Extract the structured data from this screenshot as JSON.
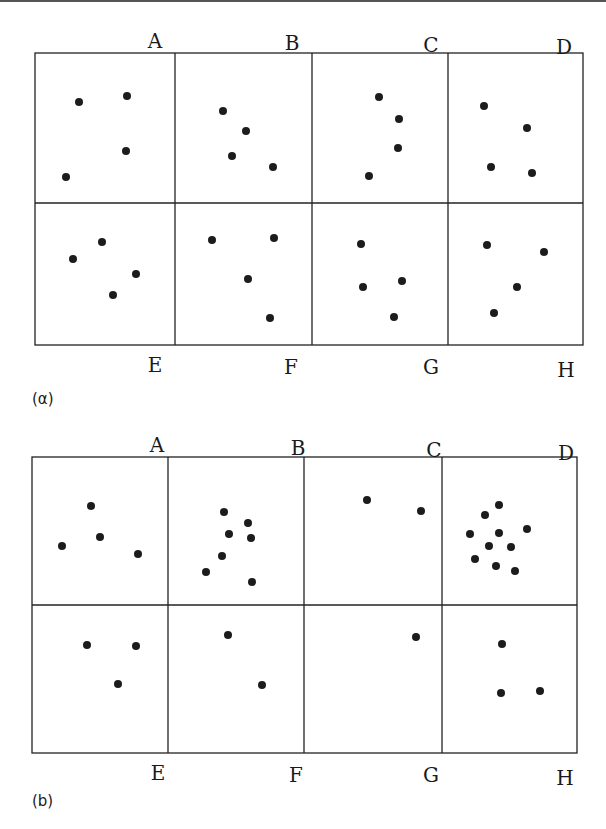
{
  "figure": {
    "panels": [
      {
        "id": "a",
        "caption": "(α)",
        "frame": {
          "x0": 35,
          "x1": 583,
          "y0": 53,
          "ymid": 203,
          "y1": 345,
          "cols": [
            35,
            175,
            312,
            448,
            583
          ]
        },
        "top_labels": [
          {
            "text": "A",
            "x": 155,
            "y": 48
          },
          {
            "text": "B",
            "x": 292,
            "y": 50
          },
          {
            "text": "C",
            "x": 431,
            "y": 52
          },
          {
            "text": "D",
            "x": 564,
            "y": 54
          }
        ],
        "bottom_labels": [
          {
            "text": "E",
            "x": 155,
            "y": 372
          },
          {
            "text": "F",
            "x": 291,
            "y": 374
          },
          {
            "text": "G",
            "x": 431,
            "y": 374
          },
          {
            "text": "H",
            "x": 566,
            "y": 377
          }
        ],
        "cells": [
          {
            "label": "A",
            "dots": [
              [
                79,
                102
              ],
              [
                127,
                96
              ],
              [
                126,
                151
              ],
              [
                66,
                177
              ]
            ]
          },
          {
            "label": "B",
            "dots": [
              [
                223,
                111
              ],
              [
                246,
                131
              ],
              [
                232,
                156
              ],
              [
                273,
                167
              ]
            ]
          },
          {
            "label": "C",
            "dots": [
              [
                379,
                97
              ],
              [
                399,
                119
              ],
              [
                398,
                148
              ],
              [
                369,
                176
              ]
            ]
          },
          {
            "label": "D",
            "dots": [
              [
                484,
                106
              ],
              [
                527,
                128
              ],
              [
                491,
                167
              ],
              [
                532,
                173
              ]
            ]
          },
          {
            "label": "E",
            "dots": [
              [
                73,
                259
              ],
              [
                102,
                242
              ],
              [
                136,
                274
              ],
              [
                113,
                295
              ]
            ]
          },
          {
            "label": "F",
            "dots": [
              [
                212,
                240
              ],
              [
                274,
                238
              ],
              [
                248,
                279
              ],
              [
                270,
                318
              ]
            ]
          },
          {
            "label": "G",
            "dots": [
              [
                361,
                244
              ],
              [
                363,
                287
              ],
              [
                402,
                281
              ],
              [
                394,
                317
              ]
            ]
          },
          {
            "label": "H",
            "dots": [
              [
                487,
                245
              ],
              [
                544,
                252
              ],
              [
                517,
                287
              ],
              [
                494,
                313
              ]
            ]
          }
        ]
      },
      {
        "id": "b",
        "caption": "(b)",
        "frame": {
          "x0": 32,
          "x1": 577,
          "y0": 457,
          "ymid": 605,
          "y1": 753,
          "cols": [
            32,
            168,
            304,
            442,
            577
          ]
        },
        "top_labels": [
          {
            "text": "A",
            "x": 157,
            "y": 452
          },
          {
            "text": "B",
            "x": 298,
            "y": 455
          },
          {
            "text": "C",
            "x": 434,
            "y": 457
          },
          {
            "text": "D",
            "x": 566,
            "y": 460
          }
        ],
        "bottom_labels": [
          {
            "text": "E",
            "x": 158,
            "y": 780
          },
          {
            "text": "F",
            "x": 296,
            "y": 782
          },
          {
            "text": "G",
            "x": 431,
            "y": 782
          },
          {
            "text": "H",
            "x": 565,
            "y": 785
          }
        ],
        "cells": [
          {
            "label": "A",
            "dots": [
              [
                91,
                506
              ],
              [
                100,
                537
              ],
              [
                62,
                546
              ],
              [
                138,
                554
              ]
            ]
          },
          {
            "label": "B",
            "dots": [
              [
                224,
                512
              ],
              [
                248,
                523
              ],
              [
                229,
                534
              ],
              [
                251,
                538
              ],
              [
                222,
                556
              ],
              [
                206,
                572
              ],
              [
                252,
                582
              ]
            ]
          },
          {
            "label": "C",
            "dots": [
              [
                367,
                500
              ],
              [
                421,
                511
              ]
            ]
          },
          {
            "label": "D",
            "dots": [
              [
                499,
                505
              ],
              [
                485,
                515
              ],
              [
                527,
                529
              ],
              [
                470,
                534
              ],
              [
                499,
                533
              ],
              [
                489,
                546
              ],
              [
                511,
                547
              ],
              [
                475,
                559
              ],
              [
                496,
                566
              ],
              [
                515,
                571
              ]
            ]
          },
          {
            "label": "E",
            "dots": [
              [
                87,
                645
              ],
              [
                136,
                646
              ],
              [
                118,
                684
              ]
            ]
          },
          {
            "label": "F",
            "dots": [
              [
                228,
                635
              ],
              [
                262,
                685
              ]
            ]
          },
          {
            "label": "G",
            "dots": [
              [
                416,
                637
              ]
            ]
          },
          {
            "label": "H",
            "dots": [
              [
                502,
                644
              ],
              [
                501,
                693
              ],
              [
                540,
                691
              ]
            ]
          }
        ]
      }
    ]
  }
}
